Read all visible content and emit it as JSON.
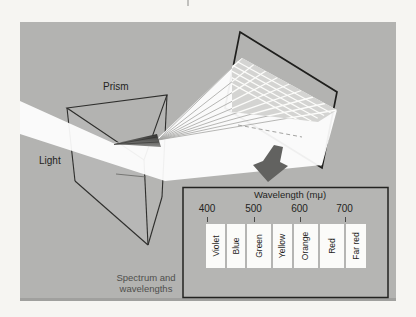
{
  "figure": {
    "labels": {
      "prism": "Prism",
      "light": "Light",
      "caption_line1": "Spectrum and",
      "caption_line2": "wavelengths"
    },
    "wavelength_panel": {
      "title": "Wavelength (mμ)",
      "ticks": [
        "400",
        "500",
        "600",
        "700"
      ],
      "bands": [
        "Violet",
        "Blue",
        "Green",
        "Yellow",
        "Orange",
        "Red",
        "Far red"
      ]
    },
    "icons": {
      "down_arrow": "down-arrow"
    },
    "colors": {
      "page_bg": "#f6f5f2",
      "panel_bg": "#b3b3b1",
      "beam_white": "#ffffff",
      "grid_face": "#d4d4d2",
      "dark_fan_top": "#2f2f2d",
      "dark_fan_bottom": "#8a8a88",
      "outline": "#2e2e2c",
      "screen_outline": "#1f1f1d",
      "arrow": "#626260",
      "text": "#242422",
      "caption_text": "#4f4f4d"
    }
  }
}
